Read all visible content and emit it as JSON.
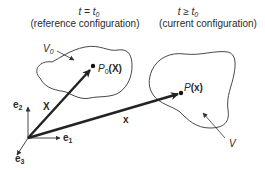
{
  "reference": {
    "time_label": "t = t",
    "time_sub": "0",
    "caption": "(reference configuration)",
    "volume_label": "V",
    "volume_sub": "0",
    "point_label": "P",
    "point_sub": "0",
    "point_arg": "(X)"
  },
  "current": {
    "time_label": "t ≥ t",
    "time_sub": "0",
    "caption": "(current configuration)",
    "volume_label": "V",
    "point_label": "P",
    "point_arg": "(x)"
  },
  "vectors": {
    "reference_position": "X",
    "current_position": "x"
  },
  "basis": {
    "e1": "e",
    "e1_sub": "1",
    "e2": "e",
    "e2_sub": "2",
    "e3": "e",
    "e3_sub": "3"
  }
}
